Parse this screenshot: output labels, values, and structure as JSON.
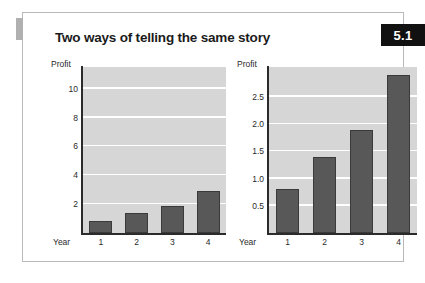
{
  "figure": {
    "title": "Two ways of telling the same story",
    "badge": "5.1",
    "accent_color": "#b0b0b0",
    "badge_bg": "#111111",
    "border_color": "#b9b9b9"
  },
  "chart_data": [
    {
      "type": "bar",
      "id": "left",
      "title": "",
      "categories": [
        "1",
        "2",
        "3",
        "4"
      ],
      "values": [
        0.8,
        1.4,
        1.9,
        2.9
      ],
      "xlabel": "Year",
      "ylabel": "Profit",
      "ylim": [
        0,
        11.5
      ],
      "yticks": [
        2,
        4,
        6,
        8,
        10
      ],
      "ytick_labels": [
        "2",
        "4",
        "6",
        "8",
        "10"
      ],
      "grid": true,
      "legend": "none",
      "bar_color": "#585858",
      "plot_bg": "#d6d6d6",
      "gridline_color": "#ffffff"
    },
    {
      "type": "bar",
      "id": "right",
      "title": "",
      "categories": [
        "1",
        "2",
        "3",
        "4"
      ],
      "values": [
        0.8,
        1.4,
        1.9,
        2.9
      ],
      "xlabel": "Year",
      "ylabel": "Profit",
      "ylim": [
        0,
        3.05
      ],
      "yticks": [
        0.5,
        1.0,
        1.5,
        2.0,
        2.5
      ],
      "ytick_labels": [
        "0.5",
        "1.0",
        "1.5",
        "2.0",
        "2.5"
      ],
      "grid": true,
      "legend": "none",
      "bar_color": "#585858",
      "plot_bg": "#d6d6d6",
      "gridline_color": "#ffffff"
    }
  ]
}
